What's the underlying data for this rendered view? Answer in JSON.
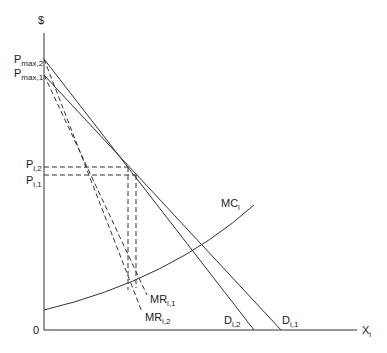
{
  "diagram": {
    "type": "economics-price-quantity",
    "y_axis_label": "$",
    "x_axis_label": {
      "main": "X",
      "sub": "i"
    },
    "origin_label": "0",
    "y_ticks": [
      {
        "main": "P",
        "sub": "max,2"
      },
      {
        "main": "P",
        "sub": "max,1"
      },
      {
        "main": "P",
        "sub": "i,2"
      },
      {
        "main": "P",
        "sub": "i,1"
      }
    ],
    "curves": [
      {
        "id": "D_i1",
        "main": "D",
        "sub": "i,1",
        "style": "solid"
      },
      {
        "id": "D_i2",
        "main": "D",
        "sub": "i,2",
        "style": "solid"
      },
      {
        "id": "MR_i1",
        "main": "MR",
        "sub": "i,1",
        "style": "dashed"
      },
      {
        "id": "MR_i2",
        "main": "MR",
        "sub": "i,2",
        "style": "dashed"
      },
      {
        "id": "MC_i",
        "main": "MC",
        "sub": "i",
        "style": "solid"
      }
    ],
    "colors": {
      "line": "#333333",
      "background": "#ffffff"
    }
  }
}
